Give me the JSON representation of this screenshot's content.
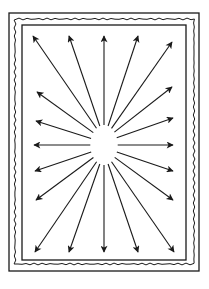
{
  "diagram": {
    "title": "",
    "colors": {
      "ink": "#1a1a1a",
      "paper": "#ffffff"
    },
    "frame": {
      "outer": {
        "x": 9,
        "y": 13,
        "w": 190,
        "h": 258
      },
      "wavy": {
        "x": 15,
        "y": 19,
        "w": 179,
        "h": 245
      },
      "inner": {
        "x": 22,
        "y": 25,
        "w": 164,
        "h": 235
      }
    },
    "center": {
      "cx": 104,
      "cy": 145,
      "rx": 13,
      "ry": 19
    },
    "arrow_count": 20,
    "arrows": [
      {
        "x": 33,
        "y": 36
      },
      {
        "x": 69,
        "y": 36
      },
      {
        "x": 104,
        "y": 36
      },
      {
        "x": 138,
        "y": 36
      },
      {
        "x": 172,
        "y": 42
      },
      {
        "x": 37,
        "y": 92
      },
      {
        "x": 172,
        "y": 87
      },
      {
        "x": 36,
        "y": 121
      },
      {
        "x": 173,
        "y": 118
      },
      {
        "x": 34,
        "y": 145
      },
      {
        "x": 173,
        "y": 145
      },
      {
        "x": 35,
        "y": 171
      },
      {
        "x": 173,
        "y": 171
      },
      {
        "x": 36,
        "y": 200
      },
      {
        "x": 173,
        "y": 200
      },
      {
        "x": 35,
        "y": 252
      },
      {
        "x": 69,
        "y": 252
      },
      {
        "x": 104,
        "y": 252
      },
      {
        "x": 138,
        "y": 252
      },
      {
        "x": 174,
        "y": 252
      }
    ],
    "caption": ""
  }
}
